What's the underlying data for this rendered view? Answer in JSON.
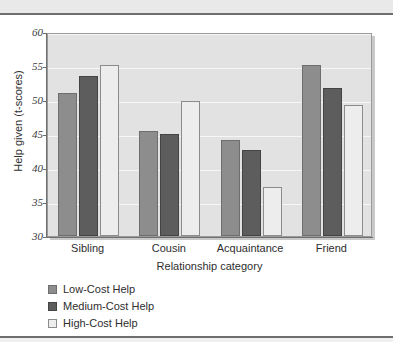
{
  "figure": {
    "background": "#ffffff",
    "rule_color": "#6e6e6e",
    "band_color": "#e9e9e9"
  },
  "chart_data": {
    "type": "bar",
    "title": "",
    "xlabel": "Relationship category",
    "ylabel": "Help given (t-scores)",
    "categories": [
      "Sibling",
      "Cousin",
      "Acquaintance",
      "Friend"
    ],
    "ylim": [
      30,
      60
    ],
    "yticks": [
      30,
      35,
      40,
      45,
      50,
      55,
      60
    ],
    "ytick_labels": [
      "30",
      "35",
      "40",
      "45",
      "50",
      "55",
      "60"
    ],
    "grid": true,
    "grid_axis": "y",
    "legend_position": "below-left",
    "plot_background": "#e2e2e2",
    "gridline_color": "#f6f6f6",
    "series": [
      {
        "name": "Low-Cost Help",
        "color": "#8d8d8d",
        "values": [
          51.0,
          45.5,
          44.1,
          55.1
        ]
      },
      {
        "name": "Medium-Cost Help",
        "color": "#5d5d5d",
        "values": [
          53.6,
          45.0,
          42.7,
          51.8
        ]
      },
      {
        "name": "High-Cost Help",
        "color": "#ededed",
        "values": [
          55.1,
          49.8,
          37.2,
          49.3
        ]
      }
    ]
  }
}
